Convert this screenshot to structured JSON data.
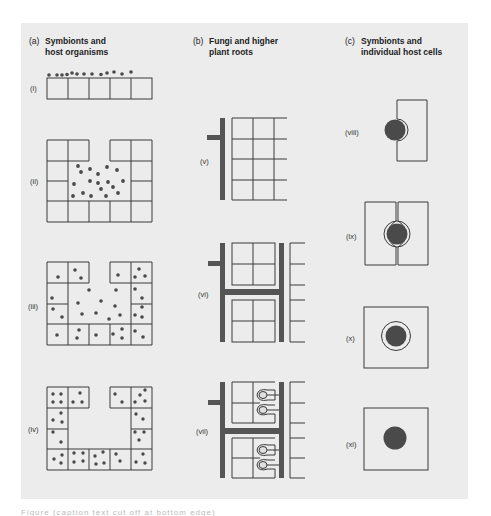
{
  "columns": [
    {
      "tag": "(a)",
      "line1": "Symbionts and",
      "line2": "host organisms"
    },
    {
      "tag": "(b)",
      "line1": "Fungi and higher",
      "line2": "plant roots"
    },
    {
      "tag": "(c)",
      "line1": "Symbionts and",
      "line2": "individual host cells"
    }
  ],
  "labels": {
    "i": "(i)",
    "ii": "(ii)",
    "iii": "(iii)",
    "iv": "(iv)",
    "v": "(v)",
    "vi": "(vi)",
    "vii": "(vii)",
    "viii": "(viii)",
    "ix": "(ix)",
    "x": "(x)",
    "xi": "(xi)"
  },
  "colors": {
    "background": "#ececec",
    "line": "#3a3a3a",
    "symbiont": "#4a4a4a",
    "hypha": "#555555"
  },
  "caption": "Figure (caption text cut off at bottom edge)"
}
